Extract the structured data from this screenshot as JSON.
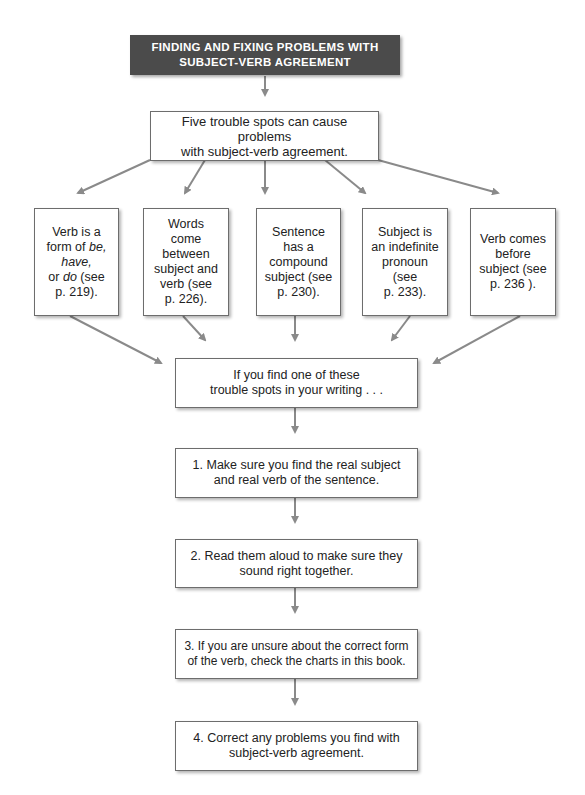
{
  "title": {
    "line1": "FINDING AND FIXING PROBLEMS WITH",
    "line2": "SUBJECT-VERB AGREEMENT",
    "background": "#4b4b4b",
    "color": "#ffffff"
  },
  "intro": {
    "line1": "Five trouble spots can cause problems",
    "line2": "with subject-verb agreement."
  },
  "trouble_spots": [
    {
      "lines": [
        "Verb is a",
        "form of ",
        "have,",
        "or ",
        "p. 219)."
      ],
      "italic_be": "be,",
      "italic_do": "do",
      "after_do": " (see"
    },
    {
      "lines": [
        "Words",
        "come",
        "between",
        "subject and",
        "verb (see",
        "p. 226)."
      ]
    },
    {
      "lines": [
        "Sentence",
        "has a",
        "compound",
        "subject (see",
        "p. 230)."
      ]
    },
    {
      "lines": [
        "Subject is",
        "an indefinite",
        "pronoun",
        "(see",
        "p. 233)."
      ]
    },
    {
      "lines": [
        "Verb comes",
        "before",
        "subject (see",
        "p. 236 )."
      ]
    }
  ],
  "merge": {
    "line1": "If you find one of these",
    "line2": "trouble spots in your writing . . ."
  },
  "steps": [
    {
      "line1": "1. Make sure you find the real subject",
      "line2": "and real verb of the sentence."
    },
    {
      "line1": "2. Read them aloud to make sure they",
      "line2": "sound right together."
    },
    {
      "line1": "3. If you are unsure about the correct form",
      "line2": "of the verb, check the charts in this book."
    },
    {
      "line1": "4. Correct any problems you find with",
      "line2": "subject-verb agreement."
    }
  ],
  "colors": {
    "arrow": "#8a8a8a",
    "border": "#6d6d6d"
  }
}
